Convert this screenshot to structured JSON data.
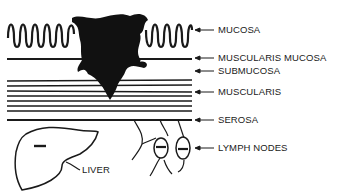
{
  "diagram": {
    "type": "anatomical cross-section",
    "labels": [
      {
        "id": "mucosa",
        "text": "MUCOSA",
        "y": 30
      },
      {
        "id": "muscularis-mucosa",
        "text": "MUSCULARIS MUCOSA",
        "y": 58
      },
      {
        "id": "submucosa",
        "text": "SUBMUCOSA",
        "y": 71
      },
      {
        "id": "muscularis",
        "text": "MUSCULARIS",
        "y": 92
      },
      {
        "id": "serosa",
        "text": "SEROSA",
        "y": 120
      },
      {
        "id": "lymph-nodes",
        "text": "LYMPH NODES",
        "y": 148
      }
    ],
    "liver_label": "LIVER",
    "colors": {
      "ink": "#1a1a1a",
      "background": "#ffffff"
    }
  }
}
